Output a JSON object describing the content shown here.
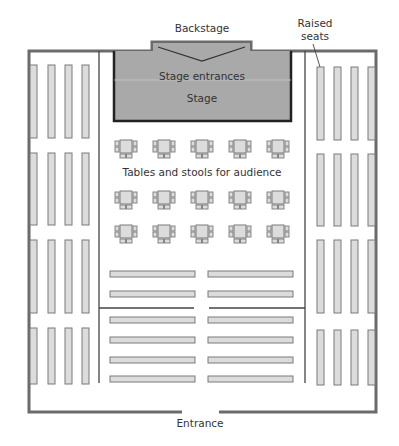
{
  "labels": {
    "backstage": "Backstage",
    "raised_seats_line1": "Raised",
    "raised_seats_line2": "seats",
    "stage_entrances": "Stage entrances",
    "stage": "Stage",
    "tables": "Tables and stools for audience",
    "entrance": "Entrance"
  },
  "colors": {
    "wall": "#6b6b6b",
    "stage_fill": "#a9a9a9",
    "stage_border": "#222222",
    "seat_fill": "#dcdcdc",
    "seat_border": "#7a7a7a",
    "inner_line": "#444444"
  },
  "layout": {
    "side_seat_columns_per_side": 4,
    "side_seat_blocks_per_side": 4,
    "table_rows": 3,
    "tables_per_row": 5,
    "bench_rows": 6,
    "benches_per_row": 2
  }
}
